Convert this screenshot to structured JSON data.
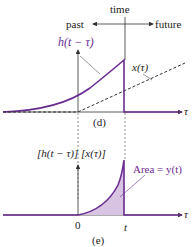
{
  "panel_d": {
    "time_label": "time",
    "past_label": "past",
    "future_label": "future",
    "h_label": "h(t − τ)",
    "x_label": "x(τ)",
    "axis_label": "τ",
    "caption": "(d)"
  },
  "panel_e": {
    "product_label": "[h(t − τ)] [x(τ)]",
    "area_label": "Area = y(t)",
    "zero_label": "0",
    "t_label": "t",
    "axis_label": "τ",
    "caption": "(e)"
  },
  "colors": {
    "purple": "#6a2c91",
    "fill": "#d9c3e3",
    "axis": "#333333"
  }
}
